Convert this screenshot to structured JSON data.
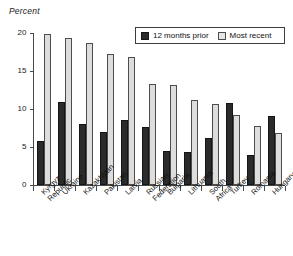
{
  "chart_data": {
    "type": "bar",
    "title": "",
    "ylabel": "Percent",
    "xlabel": "",
    "ylim": [
      0,
      20
    ],
    "yticks": [
      0,
      5,
      10,
      15,
      20
    ],
    "grid": false,
    "legend_position": "top-right",
    "categories": [
      "Kyrgyz Republic",
      "Ukraine",
      "Kazakhstan",
      "Pakistan",
      "Latvia",
      "Russian Federation",
      "Bulgaria",
      "Lithuania",
      "South Africa",
      "Turkey",
      "Romania",
      "Hungary"
    ],
    "series": [
      {
        "name": "12 months prior",
        "color": "#2b2b2b",
        "values": [
          5.8,
          10.9,
          8.0,
          7.0,
          8.6,
          7.6,
          4.5,
          4.3,
          6.2,
          10.8,
          4.0,
          9.1
        ]
      },
      {
        "name": "Most recent",
        "color": "#dddddd",
        "values": [
          19.9,
          19.4,
          18.7,
          17.2,
          16.8,
          13.3,
          13.2,
          11.2,
          10.6,
          9.2,
          7.7,
          6.9
        ]
      }
    ]
  },
  "axis": {
    "y_label": "Percent"
  },
  "legend": {
    "items": [
      {
        "label": "12 months prior",
        "style": "dark"
      },
      {
        "label": "Most recent",
        "style": "light"
      }
    ]
  }
}
